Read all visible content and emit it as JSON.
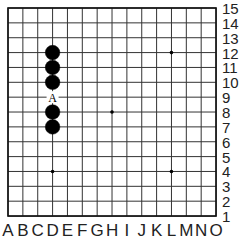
{
  "board": {
    "size": 15,
    "origin_px": [
      8,
      8
    ],
    "spacing_px": 14.86,
    "line_color": "#333333",
    "border_color": "#111111",
    "columns": [
      "A",
      "B",
      "C",
      "D",
      "E",
      "F",
      "G",
      "H",
      "I",
      "J",
      "K",
      "L",
      "M",
      "N",
      "O"
    ],
    "rows": [
      "15",
      "14",
      "13",
      "12",
      "11",
      "10",
      "9",
      "8",
      "7",
      "6",
      "5",
      "4",
      "3",
      "2",
      "1"
    ],
    "star_points": [
      [
        "D",
        "12"
      ],
      [
        "L",
        "12"
      ],
      [
        "H",
        "8"
      ],
      [
        "D",
        "4"
      ],
      [
        "L",
        "4"
      ]
    ],
    "stones": [
      {
        "color": "black",
        "col": "D",
        "row": "12"
      },
      {
        "color": "black",
        "col": "D",
        "row": "11"
      },
      {
        "color": "black",
        "col": "D",
        "row": "10"
      },
      {
        "color": "black",
        "col": "D",
        "row": "8"
      },
      {
        "color": "black",
        "col": "D",
        "row": "7"
      }
    ],
    "markers": [
      {
        "label": "A",
        "col": "D",
        "row": "9"
      }
    ]
  }
}
